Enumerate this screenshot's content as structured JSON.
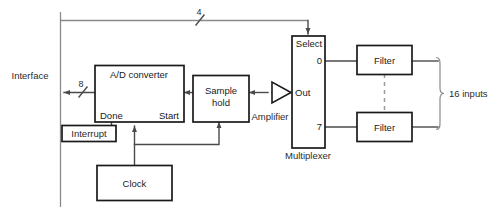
{
  "diagram": {
    "blocks": {
      "ad_converter": {
        "label": "A/D converter",
        "port_done": "Done",
        "port_start": "Start"
      },
      "sample_hold": {
        "line1": "Sample",
        "line2": "hold"
      },
      "amplifier": {
        "label": "Amplifier"
      },
      "multiplexer": {
        "label": "Multiplexer",
        "port_select": "Select",
        "port_out": "Out",
        "channel_first": "0",
        "channel_last": "7"
      },
      "filter_top": {
        "label": "Filter"
      },
      "filter_bottom": {
        "label": "Filter"
      },
      "clock": {
        "label": "Clock"
      },
      "interrupt": {
        "label": "Interrupt"
      }
    },
    "labels": {
      "interface": "Interface",
      "bus_data_width": "8",
      "bus_select_width": "4",
      "inputs_bracket": "16 inputs"
    },
    "colors": {
      "block_stroke": "#1a1a1a",
      "wire": "#4a4a4a",
      "background": "#ffffff",
      "dashed": "#9a9a9a"
    }
  }
}
